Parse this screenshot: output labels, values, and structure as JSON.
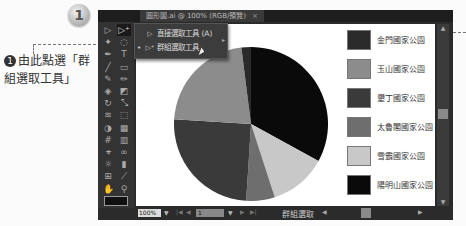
{
  "step": {
    "number": "1"
  },
  "callout": {
    "marker": "1",
    "text": "由此點選「群組選取工具」"
  },
  "window": {
    "doc_tab": {
      "title": "圓形圖.ai @ 100% (RGB/預覽)",
      "close": "×"
    }
  },
  "toolbar": {
    "tools": [
      {
        "name": "selection-tool",
        "glyph": "▷"
      },
      {
        "name": "direct-selection-tool",
        "glyph": "▷⁺",
        "active": true
      },
      {
        "name": "magic-wand-tool",
        "glyph": "✦"
      },
      {
        "name": "lasso-tool",
        "glyph": "◌"
      },
      {
        "name": "pen-tool",
        "glyph": "✒"
      },
      {
        "name": "type-tool",
        "glyph": "T"
      },
      {
        "name": "line-tool",
        "glyph": "╱"
      },
      {
        "name": "rectangle-tool",
        "glyph": "▭"
      },
      {
        "name": "paintbrush-tool",
        "glyph": "✎"
      },
      {
        "name": "pencil-tool",
        "glyph": "✏"
      },
      {
        "name": "blob-brush-tool",
        "glyph": "◈"
      },
      {
        "name": "eraser-tool",
        "glyph": "◩"
      },
      {
        "name": "rotate-tool",
        "glyph": "↻"
      },
      {
        "name": "scale-tool",
        "glyph": "⤡"
      },
      {
        "name": "warp-tool",
        "glyph": "≋"
      },
      {
        "name": "free-transform-tool",
        "glyph": "⬚"
      },
      {
        "name": "shape-builder-tool",
        "glyph": "◑"
      },
      {
        "name": "perspective-tool",
        "glyph": "▦"
      },
      {
        "name": "mesh-tool",
        "glyph": "#"
      },
      {
        "name": "gradient-tool",
        "glyph": "▥"
      },
      {
        "name": "eyedropper-tool",
        "glyph": "⌖"
      },
      {
        "name": "blend-tool",
        "glyph": "∞"
      },
      {
        "name": "symbol-sprayer-tool",
        "glyph": "☼"
      },
      {
        "name": "graph-tool",
        "glyph": "▮"
      },
      {
        "name": "artboard-tool",
        "glyph": "⊞"
      },
      {
        "name": "slice-tool",
        "glyph": "⟋"
      },
      {
        "name": "hand-tool",
        "glyph": "✋"
      },
      {
        "name": "zoom-tool",
        "glyph": "⚲"
      }
    ]
  },
  "flyout": {
    "items": [
      {
        "label": "直接選取工具 (A)",
        "icon": "▷"
      },
      {
        "label": "群組選取工具",
        "icon": "▷⁺",
        "selected": true
      }
    ]
  },
  "statusbar": {
    "zoom": "100%",
    "page": "1",
    "tool_name": "群組選取"
  },
  "chart_data": {
    "type": "pie",
    "title": "",
    "legend_position": "right",
    "categories": [
      "金門國家公園",
      "玉山國家公園",
      "墾丁國家公園",
      "太魯閣國家公園",
      "雪霸國家公園",
      "陽明山國家公園"
    ],
    "values": [
      2,
      22,
      25,
      6,
      12,
      33
    ],
    "colors": [
      "#2a2a2a",
      "#8c8c8c",
      "#3a3a3a",
      "#6e6e6e",
      "#c8c8c8",
      "#0a0a0a"
    ]
  }
}
